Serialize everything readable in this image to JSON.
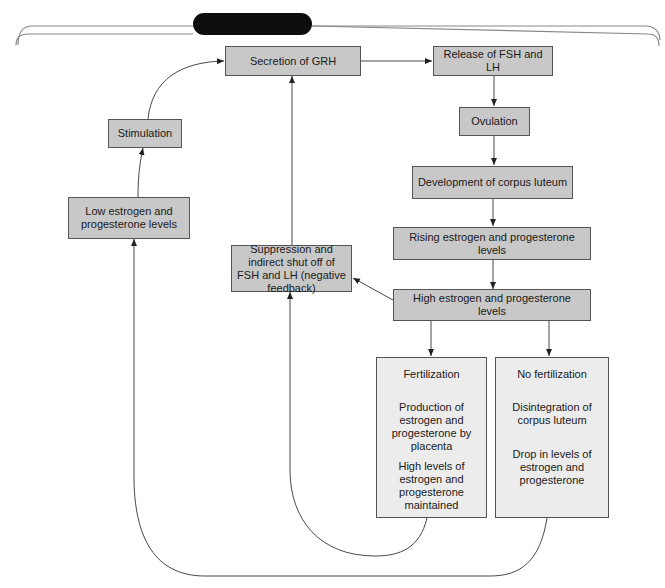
{
  "title_bar": {
    "label": "",
    "color": "#0d0d0d"
  },
  "colors": {
    "box_fill": "#c8c8c8",
    "column_fill": "#ececec",
    "border": "#555555",
    "line": "#333333"
  },
  "nodes": {
    "secretion_grh": "Secretion of GRH",
    "release_fsh_lh": "Release of FSH and LH",
    "ovulation": "Ovulation",
    "corpus_luteum_dev": "Development of corpus luteum",
    "rising_levels": "Rising estrogen and progesterone levels",
    "high_levels": "High estrogen and progesterone levels",
    "stimulation": "Stimulation",
    "low_levels": "Low estrogen and progesterone levels",
    "suppression": "Suppression and indirect shut off of FSH and LH (negative feedback)"
  },
  "fertilization": {
    "steps": [
      "Fertilization",
      "Production of estrogen and progesterone by placenta",
      "High levels of estrogen and progesterone maintained"
    ]
  },
  "no_fertilization": {
    "steps": [
      "No fertilization",
      "Disintegration of corpus luteum",
      "Drop in levels of estrogen and progesterone"
    ]
  },
  "edges": [
    [
      "secretion_grh",
      "release_fsh_lh"
    ],
    [
      "release_fsh_lh",
      "ovulation"
    ],
    [
      "ovulation",
      "corpus_luteum_dev"
    ],
    [
      "corpus_luteum_dev",
      "rising_levels"
    ],
    [
      "rising_levels",
      "high_levels"
    ],
    [
      "high_levels",
      "suppression"
    ],
    [
      "high_levels",
      "fertilization"
    ],
    [
      "high_levels",
      "no_fertilization"
    ],
    [
      "suppression",
      "secretion_grh"
    ],
    [
      "fertilization",
      "suppression"
    ],
    [
      "no_fertilization",
      "low_levels"
    ],
    [
      "low_levels",
      "stimulation"
    ],
    [
      "stimulation",
      "secretion_grh"
    ]
  ]
}
